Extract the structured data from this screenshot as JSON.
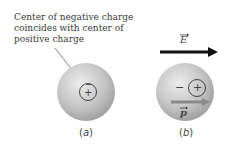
{
  "caption": {
    "lines": [
      "Center of negative charge",
      "coincides with center of",
      "positive charge"
    ]
  },
  "field_label": "E",
  "dipole_label": "p",
  "panels": [
    {
      "label_open": "(",
      "label_letter": "a",
      "label_close": ")",
      "inner_top_sign": "−",
      "inner_bottom_sign": "+"
    },
    {
      "label_open": "(",
      "label_letter": "b",
      "label_close": ")",
      "minus_sign": "−",
      "plus_sign": "+"
    }
  ],
  "colors": {
    "sphere_light": "#e6e6e6",
    "sphere_dark": "#9a9a9a",
    "arrow": "#111111",
    "dipole_arrow": "#8a8a8a",
    "text": "#3a3a3a"
  }
}
